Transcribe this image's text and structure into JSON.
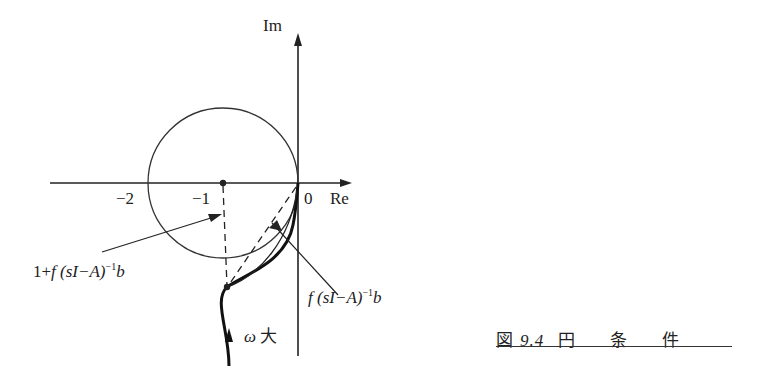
{
  "figure": {
    "axis_labels": {
      "imag": "Im",
      "real": "Re"
    },
    "ticks": {
      "minus_two": "−2",
      "minus_one": "−1",
      "zero": "0"
    },
    "annotations": {
      "one_plus_transfer_prefix": "1+",
      "transfer_f": "f",
      "transfer_body": "(sI−A)",
      "transfer_exp": "−1",
      "transfer_b": "b",
      "omega": "ω",
      "large": "大"
    },
    "caption": {
      "prefix": "図",
      "number": "9.4",
      "word1": "円",
      "word2": "条",
      "word3": "件"
    },
    "colors": {
      "ink": "#222222",
      "background": "#ffffff"
    }
  }
}
